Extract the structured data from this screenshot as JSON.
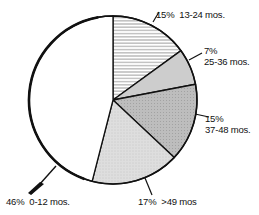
{
  "chart_data": {
    "type": "pie",
    "title": "",
    "categories": [
      "13-24 mos.",
      "25-36 mos.",
      "37-48 mos.",
      ">49 mos",
      "0-12 mos."
    ],
    "values": [
      15,
      7,
      15,
      17,
      46
    ],
    "unit": "%",
    "labels": [
      {
        "pct": "15%",
        "range": "13-24 mos.",
        "fill": "hatched"
      },
      {
        "pct": "7%",
        "range": "25-36 mos.",
        "fill": "light-gray"
      },
      {
        "pct": "15%",
        "range": "37-48 mos.",
        "fill": "medium-gray"
      },
      {
        "pct": "17%",
        "range": ">49 mos",
        "fill": "stippled-light-gray"
      },
      {
        "pct": "46%",
        "range": "0-12 mos.",
        "fill": "white"
      }
    ],
    "start_angle_deg": 0,
    "direction": "clockwise",
    "legend": "none (inline callout labels)"
  },
  "colors": {
    "outline": "#111111",
    "slice_13_24": "#ffffff",
    "hatch": "#555555",
    "slice_25_36": "#cfcfcf",
    "slice_37_48": "#b5b5b5",
    "slice_49_plus": "#dcdcdc",
    "slice_0_12": "#ffffff"
  }
}
